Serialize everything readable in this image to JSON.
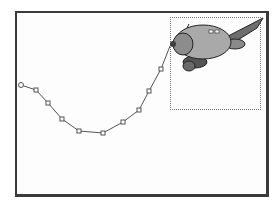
{
  "slide": {
    "frame_color": "#3a3a3a",
    "background": "#fdfdfd"
  },
  "motion_path": {
    "type": "custom-freeform",
    "line_color": "#555555",
    "point_fill": "#ffffff",
    "start_point": [
      21,
      85
    ],
    "vertices": [
      [
        36,
        90
      ],
      [
        48,
        103
      ],
      [
        62,
        119
      ],
      [
        79,
        131
      ],
      [
        103,
        133
      ],
      [
        123,
        122
      ],
      [
        139,
        110
      ],
      [
        149,
        91
      ],
      [
        161,
        69
      ]
    ],
    "end_point": [
      170,
      46
    ]
  },
  "object": {
    "icon": "airplane-clipart-icon",
    "selected": true,
    "selection_bounds": {
      "x": 170,
      "y": 17,
      "w": 91,
      "h": 93
    },
    "colors": {
      "body": "#a9a9a9",
      "wing": "#6e6e6e",
      "dark": "#3c3c3c",
      "nose": "#8c8c8c"
    }
  }
}
